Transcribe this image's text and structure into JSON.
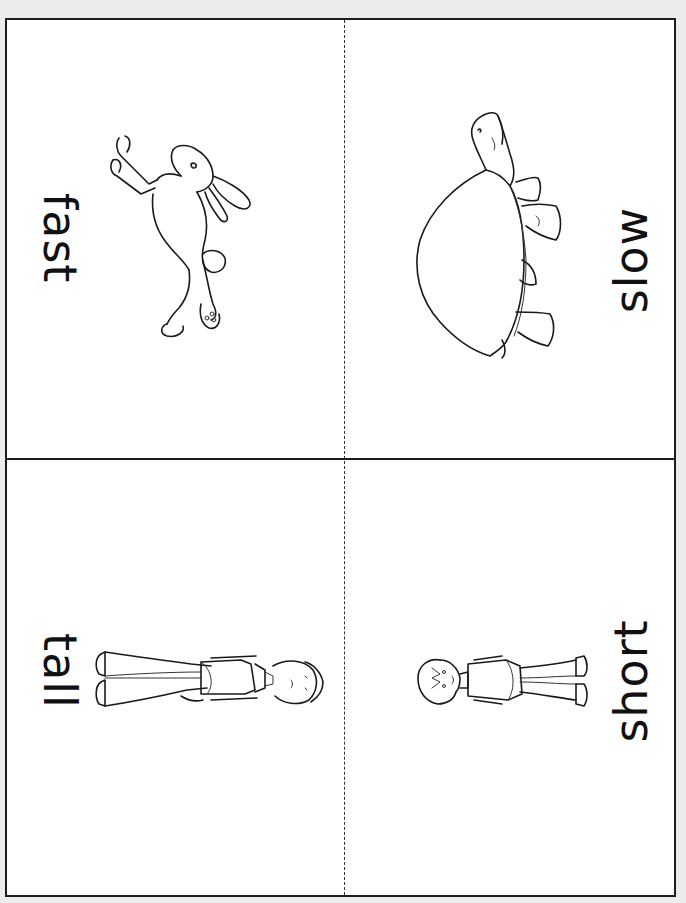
{
  "page": {
    "background_color": "#ececec",
    "card_background": "#ffffff",
    "line_color": "#1c1c1c"
  },
  "cards": [
    {
      "position": "top-left",
      "word": "fast",
      "orientation": "rotated-clockwise",
      "illustration": "rabbit-icon"
    },
    {
      "position": "top-right",
      "word": "slow",
      "orientation": "rotated-counterclockwise",
      "illustration": "tortoise-icon"
    },
    {
      "position": "bottom-left",
      "word": "tall",
      "orientation": "rotated-clockwise",
      "illustration": "tall-person-icon"
    },
    {
      "position": "bottom-right",
      "word": "short",
      "orientation": "rotated-counterclockwise",
      "illustration": "short-person-icon"
    }
  ],
  "dividers": {
    "vertical": "dashed cut line",
    "horizontal": "solid fold line"
  }
}
